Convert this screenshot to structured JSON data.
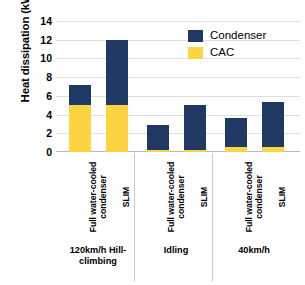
{
  "chart_data": {
    "type": "bar",
    "subtype": "stacked-bar-grouped",
    "title": "",
    "xlabel": "",
    "ylabel": "Heat dissipation (kW)",
    "ylim": [
      0,
      14
    ],
    "yticks": [
      0,
      2,
      4,
      6,
      8,
      10,
      12,
      14
    ],
    "grid": true,
    "legend_position": "top-right",
    "categories": [
      "Full water-cooled condenser",
      "SLIM",
      "Full water-cooled condenser",
      "SLIM",
      "Full water-cooled condenser",
      "SLIM"
    ],
    "groups": [
      {
        "label": "120km/h Hill-climbing",
        "categories": [
          "Full water-cooled condenser",
          "SLIM"
        ]
      },
      {
        "label": "Idling",
        "categories": [
          "Full water-cooled condenser",
          "SLIM"
        ]
      },
      {
        "label": "40km/h",
        "categories": [
          "Full water-cooled condenser",
          "SLIM"
        ]
      }
    ],
    "series": [
      {
        "name": "CAC",
        "color": "#FCD341",
        "values": [
          5.0,
          5.0,
          0.25,
          0.25,
          0.5,
          0.5
        ]
      },
      {
        "name": "Condenser",
        "color": "#1F3864",
        "values": [
          2.2,
          7.0,
          2.65,
          4.75,
          3.1,
          4.8
        ]
      }
    ],
    "totals": [
      7.2,
      12.0,
      2.9,
      5.0,
      3.6,
      5.3
    ]
  },
  "axis": {
    "y_title": "Heat dissipation (kW)",
    "y_tick_labels": [
      "0",
      "2",
      "4",
      "6",
      "8",
      "10",
      "12",
      "14"
    ]
  },
  "legend": {
    "items": [
      {
        "label": "Condenser",
        "swatch": "condenser-swatch"
      },
      {
        "label": "CAC",
        "swatch": "cac-swatch"
      }
    ]
  },
  "x_axis": {
    "category_labels": [
      "Full water-cooled\ncondenser",
      "SLIM",
      "Full water-cooled\ncondenser",
      "SLIM",
      "Full water-cooled\ncondenser",
      "SLIM"
    ],
    "group_labels": [
      "120km/h Hill-\nclimbing",
      "Idling",
      "40km/h"
    ]
  },
  "colors": {
    "condenser": "#1F3864",
    "cac": "#FCD341",
    "gridline": "#dfdfdf",
    "background": "#ffffff"
  }
}
